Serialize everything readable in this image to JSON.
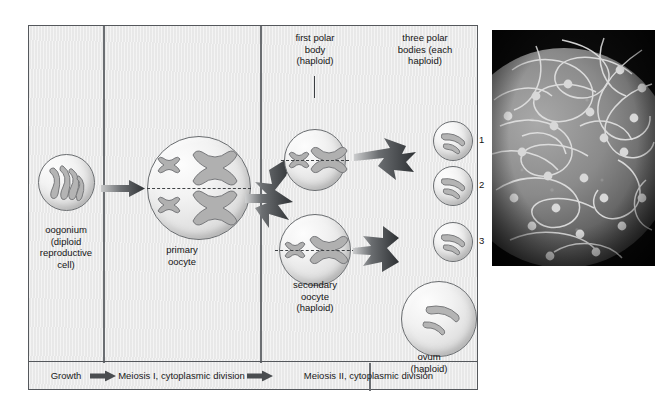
{
  "figure": {
    "type": "biology-process-diagram"
  },
  "diagram": {
    "labels": {
      "oogonium": "oogonium\n(diploid\nreproductive\ncell)",
      "primary_oocyte": "primary\noocyte",
      "first_polar_body": "first polar\nbody\n(haploid)",
      "three_polar_bodies": "three polar\nbodies (each\nhaploid)",
      "secondary_oocyte": "secondary\noocyte\n(haploid)",
      "ovum": "ovum\n(haploid)"
    },
    "polar_body_numbers": [
      "1",
      "2",
      "3"
    ],
    "phases": [
      {
        "id": "growth",
        "label": "Growth",
        "has_arrow": true
      },
      {
        "id": "meiosis-1",
        "label": "Meiosis I,\ncytoplasmic division",
        "has_arrow": true
      },
      {
        "id": "meiosis-2",
        "label": "Meiosis II, cytoplasmic division",
        "has_arrow": false
      }
    ],
    "cells": [
      {
        "id": "oogonium",
        "stage": "oogonium",
        "ploidy": "diploid",
        "chromosome_form": "threads",
        "chromosome_count": 4
      },
      {
        "id": "primary-oocyte",
        "stage": "primary oocyte",
        "ploidy": "diploid",
        "chromosome_form": "tetrad-x",
        "chromosome_count": 4
      },
      {
        "id": "first-polar-body",
        "stage": "first polar body",
        "ploidy": "haploid",
        "chromosome_form": "x",
        "chromosome_count": 2
      },
      {
        "id": "secondary-oocyte",
        "stage": "secondary oocyte",
        "ploidy": "haploid",
        "chromosome_form": "x",
        "chromosome_count": 2
      },
      {
        "id": "polar-body-1",
        "stage": "polar body",
        "ploidy": "haploid",
        "chromosome_form": "threads",
        "chromosome_count": 2
      },
      {
        "id": "polar-body-2",
        "stage": "polar body",
        "ploidy": "haploid",
        "chromosome_form": "threads",
        "chromosome_count": 2
      },
      {
        "id": "polar-body-3",
        "stage": "polar body",
        "ploidy": "haploid",
        "chromosome_form": "threads",
        "chromosome_count": 2
      },
      {
        "id": "ovum",
        "stage": "ovum",
        "ploidy": "haploid",
        "chromosome_form": "threads",
        "chromosome_count": 2
      }
    ],
    "colors": {
      "panel_background": "#ebebeb",
      "panel_border": "#55585c",
      "cell_outline": "#6a6d70",
      "chromosome": "#9a9a9a",
      "arrow": "#3f4245",
      "text": "#141414"
    }
  },
  "photo": {
    "caption_visible": false,
    "description": "Scanning electron micrograph: many sperm cells with long tails surrounding a spherical ovum",
    "palette": "grayscale"
  }
}
